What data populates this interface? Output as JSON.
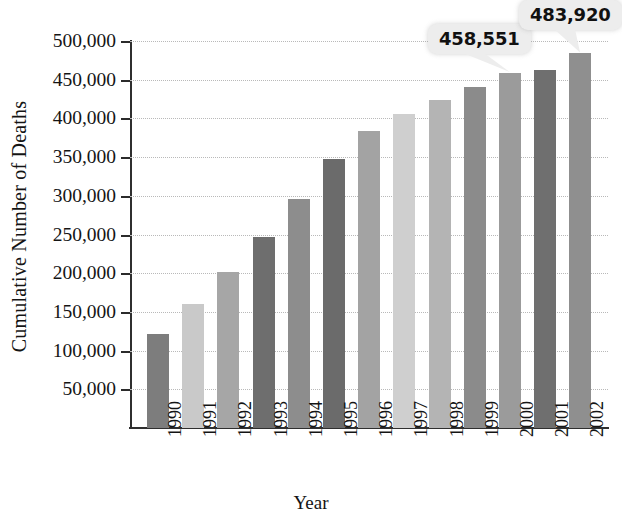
{
  "chart_data": {
    "type": "bar",
    "title": "",
    "xlabel": "Year",
    "ylabel": "Cumulative Number of Deaths",
    "categories": [
      "1990",
      "1991",
      "1992",
      "1993",
      "1994",
      "1995",
      "1996",
      "1997",
      "1998",
      "1999",
      "2000",
      "2001",
      "2002"
    ],
    "values": [
      122000,
      160000,
      202000,
      247000,
      296000,
      347000,
      384000,
      406000,
      424000,
      441000,
      458551,
      463000,
      483920
    ],
    "ylim": [
      0,
      500000
    ],
    "grid": true,
    "legend": null,
    "y_ticks": [
      500000,
      450000,
      400000,
      350000,
      300000,
      250000,
      200000,
      150000,
      100000,
      50000
    ],
    "y_tick_labels": [
      "500,000",
      "450,000",
      "400,000",
      "350,000",
      "300,000",
      "250,000",
      "200,000",
      "150,000",
      "100,000",
      "50,000"
    ],
    "annotations": [
      {
        "label": "458,551",
        "category": "2000",
        "value": 458551
      },
      {
        "label": "483,920",
        "category": "2002",
        "value": 483920
      }
    ],
    "bar_colors": [
      "#7d7d7d",
      "#c9c9c9",
      "#a6a6a6",
      "#6e6e6e",
      "#8d8d8d",
      "#6b6b6b",
      "#a3a3a3",
      "#cfcfcf",
      "#b4b4b4",
      "#8b8b8b",
      "#9b9b9b",
      "#6f6f6f",
      "#8f8f8f"
    ]
  },
  "axes": {
    "y_title": "Cumulative Number of Deaths",
    "x_title": "Year"
  },
  "colors": {
    "background": "#ffffff",
    "axis": "#2f2f2f",
    "gridline": "#b9b9b9",
    "callout_background": "#ededed",
    "text": "#141414"
  }
}
